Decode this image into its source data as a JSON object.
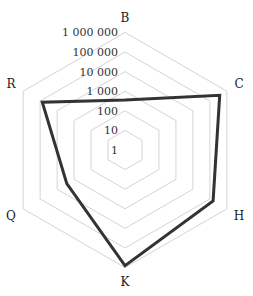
{
  "chart_data": {
    "type": "radar",
    "title": "",
    "scale": "log10",
    "axes": [
      "B",
      "C",
      "H",
      "K",
      "Q",
      "R"
    ],
    "values": [
      350,
      380000,
      155000,
      800000,
      2700,
      74000
    ],
    "tick_values": [
      1,
      10,
      100,
      1000,
      10000,
      100000,
      1000000
    ],
    "tick_labels": [
      "1",
      "10",
      "100",
      "1 000",
      "10 000",
      "100 000",
      "1 000 000"
    ],
    "range": [
      1,
      1000000
    ],
    "grid": true,
    "grid_shape": "hexagon",
    "series": [
      {
        "name": "series-1",
        "values": [
          350,
          380000,
          155000,
          800000,
          2700,
          74000
        ]
      }
    ],
    "colors": {
      "line": "#333333",
      "grid": "#d4d4d4"
    }
  }
}
